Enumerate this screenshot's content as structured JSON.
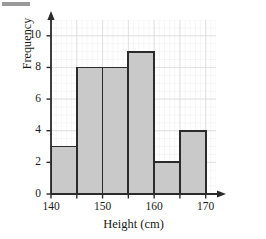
{
  "chart_data": {
    "type": "bar",
    "title": "",
    "subtitle": "",
    "xlabel": "Height (cm)",
    "ylabel": "Frequency",
    "xlim": [
      140,
      172
    ],
    "ylim": [
      0,
      11
    ],
    "grid": true,
    "legend": null,
    "bin_width": 5,
    "bin_edges": [
      140,
      145,
      150,
      155,
      160,
      165,
      170
    ],
    "categories": [
      "140-145",
      "145-150",
      "150-155",
      "155-160",
      "160-165",
      "165-170"
    ],
    "values": [
      3,
      8,
      8,
      9,
      2,
      4
    ],
    "bars": [
      {
        "start": 140,
        "end": 145,
        "value": 3
      },
      {
        "start": 145,
        "end": 150,
        "value": 8
      },
      {
        "start": 150,
        "end": 155,
        "value": 8
      },
      {
        "start": 155,
        "end": 160,
        "value": 9
      },
      {
        "start": 160,
        "end": 165,
        "value": 2
      },
      {
        "start": 165,
        "end": 170,
        "value": 4
      }
    ],
    "x_ticks_major": [
      140,
      150,
      160,
      170
    ],
    "x_ticks_minor": [
      145,
      155,
      165
    ],
    "x_tick_labels": [
      "140",
      "150",
      "160",
      "170"
    ],
    "y_ticks": [
      0,
      2,
      4,
      6,
      8,
      10
    ],
    "y_tick_labels": [
      "0",
      "2",
      "4",
      "6",
      "8",
      "10"
    ],
    "colors": {
      "bar_fill": "#c9c9c9",
      "bar_stroke": "#2b2b2b",
      "axis": "#2b2b2b",
      "grid": "#dcdcdc",
      "grid_minor": "#ececec",
      "text": "#1a1a1a",
      "background": "#ffffff"
    }
  },
  "axis_titles": {
    "x": "Height (cm)",
    "y": "Frequency"
  }
}
